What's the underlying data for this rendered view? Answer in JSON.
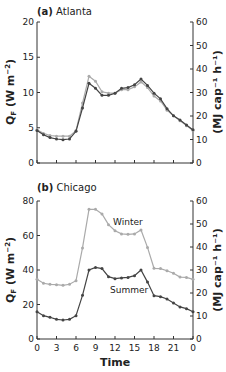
{
  "chart_data": [
    {
      "type": "line",
      "panel": "(a)",
      "title": "Atlanta",
      "xlabel": "",
      "ylabel": "Q_F (W m^-2)",
      "ylabel_right": "(MJ cap^-1 h^-1)",
      "ylim": [
        0,
        20
      ],
      "ylim_right": [
        0,
        60
      ],
      "yticks": [
        0,
        5,
        10,
        15,
        20
      ],
      "yticks_right": [
        0,
        10,
        20,
        30,
        40,
        50,
        60
      ],
      "x": [
        0,
        1,
        2,
        3,
        4,
        5,
        6,
        7,
        8,
        9,
        10,
        11,
        12,
        13,
        14,
        15,
        16,
        17,
        18,
        19,
        20,
        21,
        22,
        23,
        24
      ],
      "series": [
        {
          "name": "Summer",
          "color": "#444444",
          "values": [
            4.6,
            4.0,
            3.6,
            3.4,
            3.3,
            3.4,
            4.5,
            7.8,
            11.3,
            10.6,
            9.6,
            9.6,
            9.9,
            10.6,
            10.7,
            11.1,
            11.9,
            11.0,
            9.9,
            9.1,
            7.7,
            6.7,
            6.1,
            5.4,
            4.7
          ]
        },
        {
          "name": "Winter",
          "color": "#aaaaaa",
          "values": [
            4.7,
            4.2,
            3.9,
            3.8,
            3.8,
            3.8,
            4.6,
            8.5,
            12.3,
            11.6,
            10.1,
            9.9,
            9.9,
            10.4,
            10.4,
            10.8,
            11.5,
            10.7,
            9.5,
            8.8,
            7.5,
            6.7,
            6.0,
            5.3,
            4.6
          ]
        }
      ]
    },
    {
      "type": "line",
      "panel": "(b)",
      "title": "Chicago",
      "xlabel": "Time",
      "ylabel": "Q_F (W m^-2)",
      "ylabel_right": "(MJ cap^-1 h^-1)",
      "ylim": [
        0,
        80
      ],
      "ylim_right": [
        0,
        60
      ],
      "yticks": [
        0,
        20,
        40,
        60,
        80
      ],
      "yticks_right": [
        0,
        10,
        20,
        30,
        40,
        50,
        60
      ],
      "xticks": [
        "0",
        "3",
        "6",
        "9",
        "12",
        "15",
        "18",
        "21",
        "0"
      ],
      "x": [
        0,
        1,
        2,
        3,
        4,
        5,
        6,
        7,
        8,
        9,
        10,
        11,
        12,
        13,
        14,
        15,
        16,
        17,
        18,
        19,
        20,
        21,
        22,
        23,
        24
      ],
      "annotations": [
        "Winter",
        "Summer"
      ],
      "series": [
        {
          "name": "Winter",
          "color": "#aaaaaa",
          "values": [
            34.6,
            32.3,
            31.7,
            31.5,
            31.1,
            31.7,
            33.8,
            52.8,
            75.2,
            75.2,
            72.5,
            66.3,
            62.8,
            60.9,
            60.7,
            60.9,
            63.2,
            53.1,
            41.0,
            40.8,
            39.6,
            38.1,
            35.9,
            35.7,
            34.6
          ]
        },
        {
          "name": "Summer",
          "color": "#444444",
          "values": [
            15.8,
            13.5,
            12.6,
            11.4,
            11.0,
            11.4,
            13.5,
            25.3,
            40.0,
            41.5,
            40.8,
            36.1,
            35.0,
            35.4,
            35.7,
            36.7,
            40.0,
            33.0,
            25.1,
            24.5,
            23.2,
            20.9,
            18.6,
            17.6,
            15.8
          ]
        }
      ]
    }
  ],
  "labels": {
    "a_panel": "(a)",
    "a_city": "Atlanta",
    "b_panel": "(b)",
    "b_city": "Chicago",
    "ylabel_main": "Q",
    "ylabel_sub": "F",
    "ylabel_units": " (W m",
    "ylabel_exp": "−2",
    "ylabel_close": ")",
    "ylabel_right": "(MJ cap⁻¹ h⁻¹)",
    "xlabel": "Time",
    "winter": "Winter",
    "summer": "Summer"
  }
}
